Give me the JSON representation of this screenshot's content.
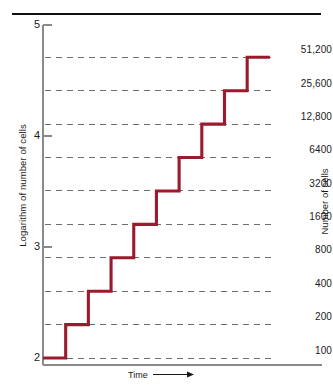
{
  "figure": {
    "background": "#ffffff",
    "rule_color": "#111111",
    "axis_color": "#8a8a8a",
    "grid_color": "#6e6e6e",
    "curve_color": "#9b1b2e"
  },
  "axis": {
    "left_title": "Logarithm of number of cells",
    "right_title": "Number of cells",
    "x_title": "Time",
    "x_arrow": "⟶",
    "left_ticks": [
      "5",
      "4",
      "3",
      "2"
    ]
  },
  "chart_data": {
    "type": "line",
    "title": "",
    "xlabel": "Time",
    "ylabel": "Logarithm of number of cells",
    "y2label": "Number of cells",
    "ylim": [
      2,
      5
    ],
    "yticks": [
      2,
      3,
      4,
      5
    ],
    "ytick_labels": [
      "2",
      "3",
      "4",
      "5"
    ],
    "grid": "horizontal-dashed",
    "legend": "none",
    "note": "Exponential (binary fission) growth plotted on a logarithmic scale; each generation doubles the cell number, producing a staircase of equal-height steps.",
    "series": [
      {
        "name": "Cell number (step curve)",
        "step": "post",
        "color": "#9b1b2e",
        "generations": [
          0,
          1,
          2,
          3,
          4,
          5,
          6,
          7,
          8,
          9
        ],
        "cells": [
          100,
          200,
          400,
          800,
          1600,
          3200,
          6400,
          12800,
          25600,
          51200
        ],
        "log_cells": [
          2.0,
          2.301,
          2.602,
          2.903,
          3.204,
          3.505,
          3.806,
          4.107,
          4.408,
          4.709
        ]
      }
    ],
    "right_axis_labels": [
      {
        "cells": 51200,
        "label": "51,200",
        "log": 4.709
      },
      {
        "cells": 25600,
        "label": "25,600",
        "log": 4.408
      },
      {
        "cells": 12800,
        "label": "12,800",
        "log": 4.107
      },
      {
        "cells": 6400,
        "label": "6400",
        "log": 3.806
      },
      {
        "cells": 3200,
        "label": "3200",
        "log": 3.505
      },
      {
        "cells": 1600,
        "label": "1600",
        "log": 3.204
      },
      {
        "cells": 800,
        "label": "800",
        "log": 2.903
      },
      {
        "cells": 400,
        "label": "400",
        "log": 2.602
      },
      {
        "cells": 200,
        "label": "200",
        "log": 2.301
      },
      {
        "cells": 100,
        "label": "100",
        "log": 2.0
      }
    ]
  }
}
